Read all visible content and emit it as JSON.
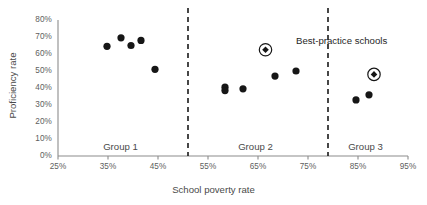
{
  "chart_data": {
    "type": "scatter",
    "title": "",
    "xlabel": "School poverty rate",
    "ylabel": "Proficiency rate",
    "xlim": [
      25,
      95
    ],
    "ylim": [
      0,
      80
    ],
    "xticks": [
      "25%",
      "35%",
      "45%",
      "55%",
      "65%",
      "75%",
      "85%",
      "95%"
    ],
    "xtick_values": [
      25,
      35,
      45,
      55,
      65,
      75,
      85,
      95
    ],
    "yticks": [
      "0%",
      "10%",
      "20%",
      "30%",
      "40%",
      "50%",
      "60%",
      "70%",
      "80%"
    ],
    "ytick_values": [
      0,
      10,
      20,
      30,
      40,
      50,
      60,
      70,
      80
    ],
    "grid": false,
    "legend_position": "inline-annotation",
    "annotations": [
      {
        "id": "best-practice",
        "label": "Best-practice schools",
        "marker": "circled-diamond",
        "x": 66.5,
        "y": 62.5
      }
    ],
    "group_dividers": [
      {
        "x": 51.0
      },
      {
        "x": 79.0
      }
    ],
    "group_labels": [
      {
        "label": "Group 1",
        "x": 37.5,
        "y": 5
      },
      {
        "label": "Group 2",
        "x": 64.5,
        "y": 5
      },
      {
        "label": "Group 3",
        "x": 86.5,
        "y": 5
      }
    ],
    "series": [
      {
        "name": "Schools",
        "marker": "filled-circle",
        "color": "#161616",
        "points": [
          {
            "x": 34.8,
            "y": 64.5,
            "group": "Group 1"
          },
          {
            "x": 37.6,
            "y": 69.5,
            "group": "Group 1"
          },
          {
            "x": 39.6,
            "y": 65.0,
            "group": "Group 1"
          },
          {
            "x": 41.6,
            "y": 68.0,
            "group": "Group 1"
          },
          {
            "x": 44.4,
            "y": 51.0,
            "group": "Group 1"
          },
          {
            "x": 58.4,
            "y": 40.5,
            "group": "Group 2"
          },
          {
            "x": 58.4,
            "y": 38.5,
            "group": "Group 2"
          },
          {
            "x": 62.0,
            "y": 39.5,
            "group": "Group 2"
          },
          {
            "x": 68.4,
            "y": 47.0,
            "group": "Group 2"
          },
          {
            "x": 72.6,
            "y": 50.0,
            "group": "Group 2"
          },
          {
            "x": 84.6,
            "y": 33.0,
            "group": "Group 3"
          },
          {
            "x": 87.2,
            "y": 36.0,
            "group": "Group 3"
          }
        ]
      },
      {
        "name": "Best-practice schools",
        "marker": "circled-diamond",
        "color": "#161616",
        "points": [
          {
            "x": 88.2,
            "y": 48.0,
            "group": "Group 3"
          }
        ]
      }
    ]
  }
}
